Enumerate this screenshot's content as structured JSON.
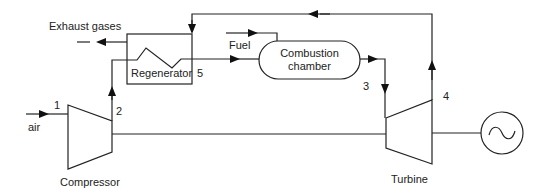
{
  "diagram": {
    "components": {
      "compressor": "Compressor",
      "turbine": "Turbine",
      "regenerator": "Regenerator",
      "combustion_chamber_line1": "Combustion",
      "combustion_chamber_line2": "chamber",
      "generator": "generator-icon"
    },
    "streams": {
      "air": "air",
      "fuel": "Fuel",
      "exhaust": "Exhaust gases"
    },
    "state_points": [
      "1",
      "2",
      "3",
      "4",
      "5"
    ],
    "colors": {
      "line": "#222222",
      "background": "#ffffff"
    }
  }
}
